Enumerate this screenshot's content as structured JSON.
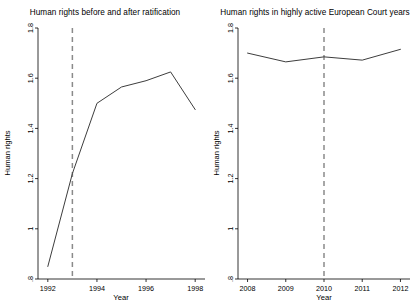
{
  "figure": {
    "width": 420,
    "height": 306,
    "background": "#ffffff",
    "line_color": "#3d3d3d",
    "reference_line_color": "#8a8a8a",
    "axis_color": "#000000"
  },
  "chart_data": [
    {
      "type": "line",
      "title": "Human rights before and after ratification",
      "xlabel": "Year",
      "ylabel": "Human rights",
      "x": [
        1992,
        1993,
        1994,
        1995,
        1996,
        1997,
        1998
      ],
      "values": [
        0.85,
        1.22,
        1.5,
        1.565,
        1.59,
        1.625,
        1.475
      ],
      "xlim": [
        1991.6,
        1998.4
      ],
      "ylim": [
        0.8,
        1.8
      ],
      "xticks": [
        1992,
        1994,
        1996,
        1998
      ],
      "xticklabels": [
        "1992",
        "1994",
        "1996",
        "1998"
      ],
      "yticks": [
        0.8,
        1.0,
        1.2,
        1.4,
        1.6,
        1.8
      ],
      "yticklabels": [
        ".8",
        "1",
        "1.2",
        "1.4",
        "1.6",
        "1.8"
      ],
      "grid": false,
      "legend": "none",
      "annotations": [
        {
          "kind": "vertical-reference-line",
          "x": 1993,
          "style": "dashed"
        }
      ]
    },
    {
      "type": "line",
      "title": "Human rights in highly active European Court years",
      "xlabel": "Year",
      "ylabel": "Human rights",
      "x": [
        2008,
        2009,
        2010,
        2011,
        2012
      ],
      "values": [
        1.7,
        1.665,
        1.685,
        1.672,
        1.715
      ],
      "xlim": [
        2007.75,
        2012.25
      ],
      "ylim": [
        0.8,
        1.8
      ],
      "xticks": [
        2008,
        2009,
        2010,
        2011,
        2012
      ],
      "xticklabels": [
        "2008",
        "2009",
        "2010",
        "2011",
        "2012"
      ],
      "yticks": [
        0.8,
        1.0,
        1.2,
        1.4,
        1.6,
        1.8
      ],
      "yticklabels": [
        ".8",
        "1",
        "1.2",
        "1.4",
        "1.6",
        "1.8"
      ],
      "grid": false,
      "legend": "none",
      "annotations": [
        {
          "kind": "vertical-reference-line",
          "x": 2010,
          "style": "dashed"
        }
      ]
    }
  ]
}
